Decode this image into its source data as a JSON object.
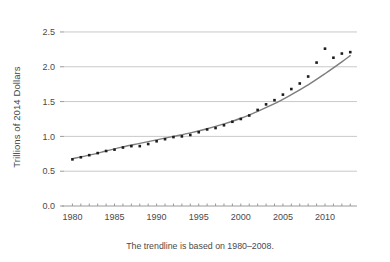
{
  "chart_data": {
    "type": "scatter",
    "title": "",
    "xlabel": "",
    "ylabel": "Trillions of 2014 Dollars",
    "caption": "The trendline is based on 1980–2008.",
    "xlim": [
      1979.0,
      2013.8
    ],
    "ylim": [
      0.0,
      2.6
    ],
    "xticks": [
      1980,
      1985,
      1990,
      1995,
      2000,
      2005,
      2010
    ],
    "xtick_labels": [
      "1980",
      "1985",
      "1990",
      "1995",
      "2000",
      "2005",
      "2010"
    ],
    "yticks": [
      0.0,
      0.5,
      1.0,
      1.5,
      2.0,
      2.5
    ],
    "ytick_labels": [
      "0.0",
      "0.5",
      "1.0",
      "1.5",
      "2.0",
      "2.5"
    ],
    "minor_xticks_every": 1,
    "grid": "horizontal",
    "legend": "none",
    "point_color": "#1c1c1c",
    "trendline_color": "#7d7d7d",
    "gridline_color": "#c9c9c9",
    "series": [
      {
        "name": "Observed",
        "marker": "square",
        "x": [
          1980,
          1981,
          1982,
          1983,
          1984,
          1985,
          1986,
          1987,
          1988,
          1989,
          1990,
          1991,
          1992,
          1993,
          1994,
          1995,
          1996,
          1997,
          1998,
          1999,
          2000,
          2001,
          2002,
          2003,
          2004,
          2005,
          2006,
          2007,
          2008,
          2009,
          2010,
          2011,
          2012,
          2013
        ],
        "values": [
          0.67,
          0.7,
          0.73,
          0.76,
          0.79,
          0.81,
          0.84,
          0.86,
          0.86,
          0.89,
          0.93,
          0.96,
          0.99,
          1.0,
          1.02,
          1.06,
          1.1,
          1.12,
          1.16,
          1.21,
          1.25,
          1.3,
          1.38,
          1.46,
          1.52,
          1.6,
          1.68,
          1.76,
          1.86,
          2.06,
          2.26,
          2.13,
          2.19,
          2.21
        ]
      },
      {
        "name": "Trendline",
        "fit_range": [
          1980,
          2008
        ],
        "extrapolated_to": 2013,
        "x": [
          1980,
          1982,
          1984,
          1986,
          1988,
          1990,
          1992,
          1994,
          1996,
          1998,
          2000,
          2002,
          2004,
          2006,
          2008,
          2010,
          2012,
          2013
        ],
        "values": [
          0.68,
          0.73,
          0.79,
          0.85,
          0.9,
          0.95,
          1.0,
          1.05,
          1.11,
          1.18,
          1.26,
          1.36,
          1.47,
          1.6,
          1.74,
          1.9,
          2.07,
          2.16
        ]
      }
    ]
  }
}
